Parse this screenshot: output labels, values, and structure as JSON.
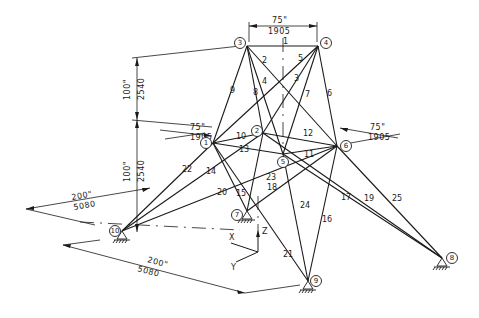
{
  "figure": {
    "type": "space-truss-isometric",
    "nodes": [
      {
        "id": "1",
        "label": "1",
        "x": 213,
        "y": 143
      },
      {
        "id": "2",
        "label": "2",
        "x": 263,
        "y": 133
      },
      {
        "id": "3",
        "label": "3",
        "x": 247,
        "y": 46
      },
      {
        "id": "4",
        "label": "4",
        "x": 318,
        "y": 46
      },
      {
        "id": "5",
        "label": "5",
        "x": 283,
        "y": 154
      },
      {
        "id": "6",
        "label": "6",
        "x": 337,
        "y": 146
      },
      {
        "id": "7",
        "label": "7",
        "x": 247,
        "y": 211
      },
      {
        "id": "8",
        "label": "8",
        "x": 442,
        "y": 258
      },
      {
        "id": "9",
        "label": "9",
        "x": 308,
        "y": 281
      },
      {
        "id": "10",
        "label": "10",
        "x": 122,
        "y": 231
      }
    ],
    "members": [
      {
        "id": "1",
        "label": "1",
        "from": "3",
        "to": "4",
        "lx": 283,
        "ly": 44
      },
      {
        "id": "2",
        "label": "2",
        "from": "3",
        "to": "5",
        "lx": 262,
        "ly": 63
      },
      {
        "id": "3",
        "label": "3",
        "from": "4",
        "to": "1",
        "lx": 294,
        "ly": 81
      },
      {
        "id": "4",
        "label": "4",
        "from": "3",
        "to": "6",
        "lx": 262,
        "ly": 84
      },
      {
        "id": "5",
        "label": "5",
        "from": "4",
        "to": "2",
        "lx": 298,
        "ly": 61
      },
      {
        "id": "6",
        "label": "6",
        "from": "4",
        "to": "6",
        "lx": 327,
        "ly": 96
      },
      {
        "id": "7",
        "label": "7",
        "from": "4",
        "to": "5",
        "lx": 305,
        "ly": 97
      },
      {
        "id": "8",
        "label": "8",
        "from": "3",
        "to": "2",
        "lx": 253,
        "ly": 95
      },
      {
        "id": "9",
        "label": "9",
        "from": "3",
        "to": "1",
        "lx": 230,
        "ly": 93
      },
      {
        "id": "10",
        "label": "10",
        "from": "1",
        "to": "2",
        "lx": 236,
        "ly": 139
      },
      {
        "id": "11",
        "label": "11",
        "from": "5",
        "to": "6",
        "lx": 304,
        "ly": 157
      },
      {
        "id": "12",
        "label": "12",
        "from": "2",
        "to": "6",
        "lx": 303,
        "ly": 136
      },
      {
        "id": "13",
        "label": "13",
        "from": "1",
        "to": "5",
        "lx": 239,
        "ly": 152
      },
      {
        "id": "14",
        "label": "14",
        "from": "10",
        "to": "2",
        "lx": 206,
        "ly": 174
      },
      {
        "id": "15",
        "label": "15",
        "from": "1",
        "to": "7",
        "lx": 236,
        "ly": 196
      },
      {
        "id": "16",
        "label": "16",
        "from": "6",
        "to": "9",
        "lx": 322,
        "ly": 222
      },
      {
        "id": "17",
        "label": "17",
        "from": "5",
        "to": "8",
        "lx": 341,
        "ly": 200
      },
      {
        "id": "18",
        "label": "18",
        "from": "7",
        "to": "6",
        "lx": 267,
        "ly": 190
      },
      {
        "id": "19",
        "label": "19",
        "from": "2",
        "to": "8",
        "lx": 364,
        "ly": 201
      },
      {
        "id": "20",
        "label": "20",
        "from": "10",
        "to": "6",
        "lx": 217,
        "ly": 195
      },
      {
        "id": "21",
        "label": "21",
        "from": "1",
        "to": "9",
        "lx": 283,
        "ly": 257
      },
      {
        "id": "22",
        "label": "22",
        "from": "10",
        "to": "1",
        "lx": 182,
        "ly": 172
      },
      {
        "id": "23",
        "label": "23",
        "from": "7",
        "to": "2",
        "lx": 266,
        "ly": 180
      },
      {
        "id": "24",
        "label": "24",
        "from": "5",
        "to": "9",
        "lx": 300,
        "ly": 208
      },
      {
        "id": "25",
        "label": "25",
        "from": "6",
        "to": "8",
        "lx": 392,
        "ly": 201
      }
    ],
    "supports": [
      "7",
      "8",
      "9",
      "10"
    ],
    "dimensions": [
      {
        "id": "top-width",
        "imperial": "75\"",
        "metric": "1905"
      },
      {
        "id": "upper-height",
        "imperial": "100\"",
        "metric": "2540"
      },
      {
        "id": "lower-height",
        "imperial": "100\"",
        "metric": "2540"
      },
      {
        "id": "mid-left-width",
        "imperial": "75\"",
        "metric": "1905"
      },
      {
        "id": "mid-right-width",
        "imperial": "75\"",
        "metric": "1905"
      },
      {
        "id": "base-left",
        "imperial": "200\"",
        "metric": "5080"
      },
      {
        "id": "base-front",
        "imperial": "200\"",
        "metric": "5080"
      }
    ],
    "axes": {
      "x": "X",
      "y": "Y",
      "z": "Z"
    }
  }
}
